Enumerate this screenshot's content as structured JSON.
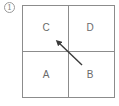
{
  "figure": {
    "marker": "1",
    "grid": {
      "rows": 2,
      "cols": 2,
      "line_color": "#8c8c8c"
    },
    "cells": {
      "top_left": "C",
      "top_right": "D",
      "bottom_left": "A",
      "bottom_right": "B"
    },
    "arrow": {
      "from": "B",
      "to": "C",
      "color": "#3a3a3a"
    }
  }
}
